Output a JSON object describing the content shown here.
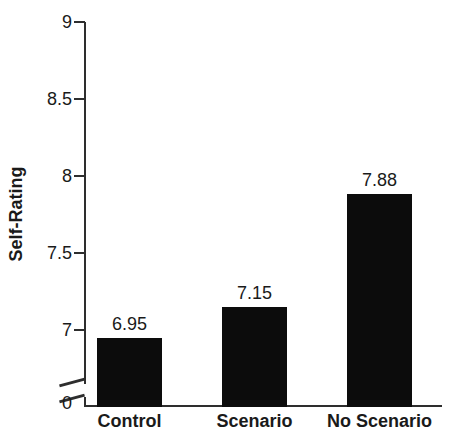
{
  "chart_data": {
    "type": "bar",
    "title": "",
    "xlabel": "",
    "ylabel": "Self-Rating",
    "categories": [
      "Control",
      "Scenario",
      "No Scenario"
    ],
    "values": [
      6.95,
      7.15,
      7.88
    ],
    "value_labels": [
      "6.95",
      "7.15",
      "7.88"
    ],
    "y_ticks": [
      "9",
      "8.5",
      "8",
      "7.5",
      "7"
    ],
    "zero_tick": "0",
    "ylim": [
      0,
      9
    ],
    "displayed_range_above_break": [
      7,
      9
    ],
    "axis_break": true,
    "grid": false,
    "legend": "none",
    "bar_color": "#0c0c0c",
    "background_color": "#ffffff",
    "text_color": "#1a1a1a"
  }
}
